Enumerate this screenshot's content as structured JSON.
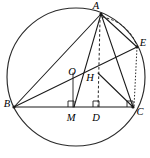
{
  "figure": {
    "type": "geometry-diagram",
    "colors": {
      "stroke": "#1a1a1a",
      "circle": "#2b2b2b",
      "background": "#ffffff"
    },
    "circle": {
      "cx": 76,
      "cy": 77,
      "r": 69
    },
    "points": {
      "A": {
        "label": "A",
        "x": 101,
        "y": 14,
        "label_x": 98,
        "label_y": 6
      },
      "B": {
        "label": "B",
        "x": 14,
        "y": 107,
        "label_x": 7,
        "label_y": 105
      },
      "C": {
        "label": "C",
        "x": 133,
        "y": 107,
        "label_x": 139,
        "label_y": 112
      },
      "E": {
        "label": "E",
        "x": 137,
        "y": 47,
        "label_x": 142,
        "label_y": 44
      },
      "O": {
        "label": "O",
        "x": 73,
        "y": 79,
        "label_x": 72,
        "label_y": 73
      },
      "H": {
        "label": "H",
        "x": 98,
        "y": 73,
        "label_x": 91,
        "label_y": 78
      },
      "M": {
        "label": "M",
        "x": 73,
        "y": 107,
        "label_x": 71,
        "label_y": 118
      },
      "D": {
        "label": "D",
        "x": 98,
        "y": 107,
        "label_x": 96,
        "label_y": 118
      }
    },
    "segments": [
      {
        "name": "BC",
        "from": "B",
        "to": "C",
        "style": "solid"
      },
      {
        "name": "BA",
        "from": "B",
        "to": "A",
        "style": "solid"
      },
      {
        "name": "AC",
        "from": "A",
        "to": "C",
        "style": "solid"
      },
      {
        "name": "BE",
        "from": "B",
        "to": "E",
        "style": "solid"
      },
      {
        "name": "AE",
        "from": "A",
        "to": "E",
        "style": "solid"
      },
      {
        "name": "EC",
        "from": "E",
        "to": "C",
        "style": "solid"
      },
      {
        "name": "HC",
        "from": "H",
        "to": "C",
        "style": "solid"
      },
      {
        "name": "AM-vertical",
        "from": "A",
        "to": "M",
        "style": "solid"
      },
      {
        "name": "OM",
        "from": "O",
        "to": "M",
        "style": "solid"
      },
      {
        "name": "AD-altitude",
        "from": "A",
        "to": "D",
        "style": "dashed"
      },
      {
        "name": "EC-dotted",
        "from": "E",
        "to": "C",
        "style": "dotted"
      },
      {
        "name": "arc-AE",
        "from": "A",
        "to": "E",
        "style": "dashed-arc"
      }
    ],
    "right_angles": [
      {
        "name": "right-angle-at-M",
        "x": 73,
        "y": 107
      },
      {
        "name": "right-angle-at-D",
        "x": 98,
        "y": 107
      },
      {
        "name": "right-angle-at-C",
        "x": 133,
        "y": 107
      }
    ]
  }
}
